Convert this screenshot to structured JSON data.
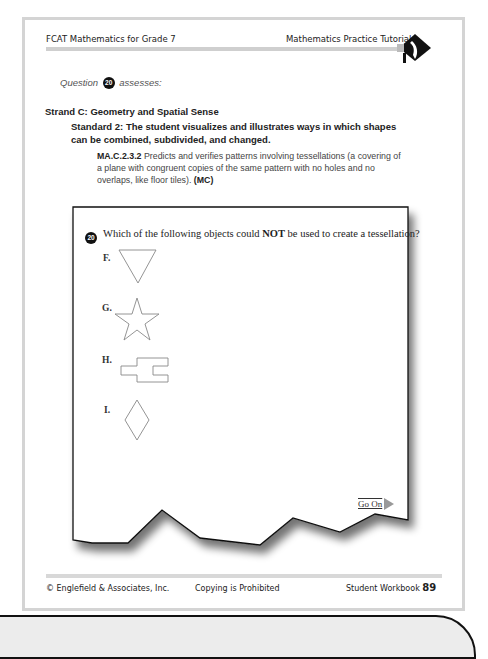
{
  "header": {
    "left_title": "FCAT Mathematics for Grade 7",
    "right_title": "Mathematics Practice Tutorial",
    "logo_icon": "pointing-hand-diamond-icon"
  },
  "assessment": {
    "question_prefix": "Question",
    "question_number": "20",
    "question_suffix": "assesses:",
    "strand": "Strand C: Geometry and Spatial Sense",
    "standard": "Standard 2: The student visualizes and illustrates ways in which shapes can be combined, subdivided, and changed.",
    "benchmark_code": "MA.C.2.3.2",
    "benchmark_text": "Predicts and verifies patterns involving tessellations (a covering of a plane with congruent copies of the same pattern with no holes and no overlaps, like floor tiles).",
    "benchmark_type": "(MC)"
  },
  "question": {
    "number": "20",
    "text_before": "Which of the following objects could ",
    "text_emphasis": "NOT",
    "text_after": " be used to create a tessellation?",
    "options": [
      {
        "label": "F.",
        "shape": "inverted-triangle"
      },
      {
        "label": "G.",
        "shape": "five-point-star"
      },
      {
        "label": "H.",
        "shape": "puzzle-piece"
      },
      {
        "label": "I.",
        "shape": "diamond"
      }
    ],
    "go_on_label": "Go On"
  },
  "footer": {
    "copyright": "© Englefield & Associates, Inc.",
    "notice": "Copying is Prohibited",
    "workbook_label": "Student Workbook",
    "page_number": "89"
  },
  "colors": {
    "frame": "#d4d4d4",
    "badge": "#111111",
    "shape_stroke": "#888888"
  }
}
